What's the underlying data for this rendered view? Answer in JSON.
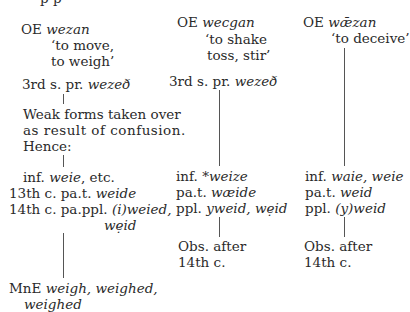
{
  "top_cutoff": "p          p",
  "col1": {
    "head_prefix": "OE",
    "head_word": "wezan",
    "gloss1": "‘to move,",
    "gloss2": "to weigh’",
    "pres_prefix": "3rd s. pr.",
    "pres_form": "wezeð",
    "note1": "Weak forms taken over",
    "note2": "as result of confusion.",
    "note3": "Hence:",
    "inf_prefix": "inf.",
    "inf_form": "weie",
    "inf_suffix": ", etc.",
    "pat_prefix": "13th c. pa.t.",
    "pat_form": "weide",
    "ppl_prefix": "14th c. pa.ppl.",
    "ppl_form": "(i)weied,",
    "ppl_form2": "wẹid",
    "mne_prefix": "MnE",
    "mne_forms": "weigh, weighed,",
    "mne_forms2": "weighed"
  },
  "col2": {
    "head_prefix": "OE",
    "head_word": "wecgan",
    "gloss1": "‘to shake",
    "gloss2": "toss, stir’",
    "pres_prefix": "3rd s. pr.",
    "pres_form": "wezeð",
    "inf_prefix": "inf.",
    "inf_form": "*weize",
    "pat_prefix": "pa.t.",
    "pat_form": "wæide",
    "ppl_prefix": "ppl.",
    "ppl_form": "yweid, wẹid",
    "obs1": "Obs. after",
    "obs2": "14th  c."
  },
  "col3": {
    "head_prefix": "OE",
    "head_word": "wǣzan",
    "gloss1": "‘to deceive’",
    "inf_prefix": "inf.",
    "inf_form": "waie, weie",
    "pat_prefix": "pa.t.",
    "pat_form": "weid",
    "ppl_prefix": "ppl.",
    "ppl_form": "(y)weid",
    "obs1": "Obs. after",
    "obs2": "14th c."
  }
}
